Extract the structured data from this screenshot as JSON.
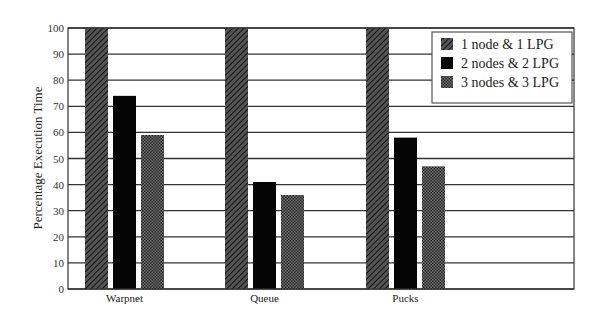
{
  "chart_data": {
    "type": "bar",
    "title": "",
    "xlabel": "",
    "ylabel": "Percentage Execution Time",
    "ylim": [
      0,
      100
    ],
    "yticks": [
      0,
      10,
      20,
      30,
      40,
      50,
      60,
      70,
      80,
      90,
      100
    ],
    "grid": true,
    "legend_position": "upper right",
    "categories": [
      "Warpnet",
      "Queue",
      "Pucks"
    ],
    "series": [
      {
        "name": "1 node & 1 LPG",
        "pattern": "hatched",
        "values": [
          100,
          100,
          100
        ]
      },
      {
        "name": "2 nodes & 2 LPG",
        "pattern": "solid-black",
        "values": [
          74,
          41,
          58
        ]
      },
      {
        "name": "3 nodes & 3 LPG",
        "pattern": "checkered",
        "values": [
          59,
          36,
          47
        ]
      }
    ]
  },
  "colors": {
    "hatched": "#3a3a3a",
    "solid": "#050505",
    "checkered": "#2b2b2b",
    "grid": "#333333"
  }
}
